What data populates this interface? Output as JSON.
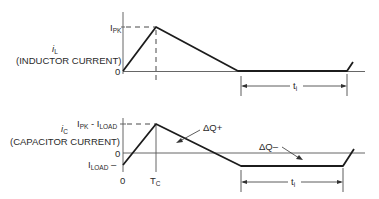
{
  "top_plot": {
    "signal_symbol": "i",
    "signal_subscript": "L",
    "signal_description": "(INDUCTOR CURRENT)",
    "y_tick_peak_main": "I",
    "y_tick_peak_sub": "PK",
    "y_tick_zero": "0",
    "interval_main": "t",
    "interval_sub": "i"
  },
  "bottom_plot": {
    "signal_symbol": "i",
    "signal_subscript": "C",
    "signal_description": "(CAPACITOR CURRENT)",
    "y_tick_peak_a": "I",
    "y_tick_peak_a_sub": "PK",
    "y_tick_peak_dash": " - ",
    "y_tick_peak_b": "I",
    "y_tick_peak_b_sub": "LOAD",
    "y_tick_zero": "0",
    "y_tick_load_main": "I",
    "y_tick_load_sub": "LOAD",
    "y_tick_load_dash": " –",
    "x_tick_zero": "0",
    "x_tick_tc_main": "T",
    "x_tick_tc_sub": "C",
    "annotation_charge_plus": "ΔQ+",
    "annotation_charge_minus": "ΔQ–",
    "interval_main": "t",
    "interval_sub": "i"
  }
}
